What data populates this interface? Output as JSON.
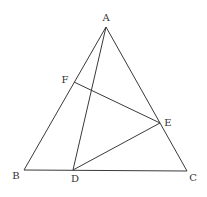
{
  "diagram": {
    "type": "geometry",
    "stroke_color": "#3a3a3a",
    "label_color": "#333333",
    "points": {
      "A": {
        "x": 106,
        "y": 27,
        "label": "A",
        "lx": 106,
        "ly": 21
      },
      "B": {
        "x": 24,
        "y": 170,
        "label": "B",
        "lx": 16,
        "ly": 179
      },
      "C": {
        "x": 187,
        "y": 171,
        "label": "C",
        "lx": 193,
        "ly": 181
      },
      "D": {
        "x": 73,
        "y": 170,
        "label": "D",
        "lx": 75,
        "ly": 182
      },
      "E": {
        "x": 160,
        "y": 123,
        "label": "E",
        "lx": 168,
        "ly": 126
      },
      "F": {
        "x": 74,
        "y": 82,
        "label": "F",
        "lx": 65,
        "ly": 83
      }
    },
    "segments": [
      [
        "A",
        "B"
      ],
      [
        "A",
        "C"
      ],
      [
        "B",
        "C"
      ],
      [
        "A",
        "D"
      ],
      [
        "F",
        "E"
      ],
      [
        "D",
        "E"
      ]
    ]
  }
}
